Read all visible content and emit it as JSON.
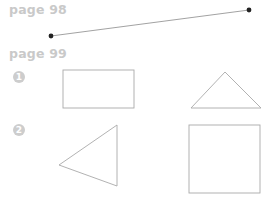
{
  "sections": [
    {
      "label": "page 98"
    },
    {
      "label": "page 99"
    }
  ],
  "exercises": [
    {
      "number": "1"
    },
    {
      "number": "2"
    }
  ],
  "figures": {
    "segment": {
      "from": [
        51,
        36
      ],
      "to": [
        249,
        10
      ],
      "endpoints": "filled-dots"
    },
    "rectangle": {
      "x": 63,
      "y": 70,
      "width": 71,
      "height": 38
    },
    "triangle_up": {
      "points": [
        [
          225,
          72
        ],
        [
          191,
          108
        ],
        [
          261,
          108
        ]
      ]
    },
    "triangle_left": {
      "points": [
        [
          117,
          125
        ],
        [
          59,
          165
        ],
        [
          117,
          186
        ]
      ]
    },
    "square": {
      "x": 189,
      "y": 125,
      "width": 71,
      "height": 68
    }
  },
  "colors": {
    "heading": "#c9c9c9",
    "badge": "#cdcdcd",
    "shape_stroke": "#a9a9a9",
    "line_stroke": "#8a8a8a",
    "dot": "#222222"
  }
}
